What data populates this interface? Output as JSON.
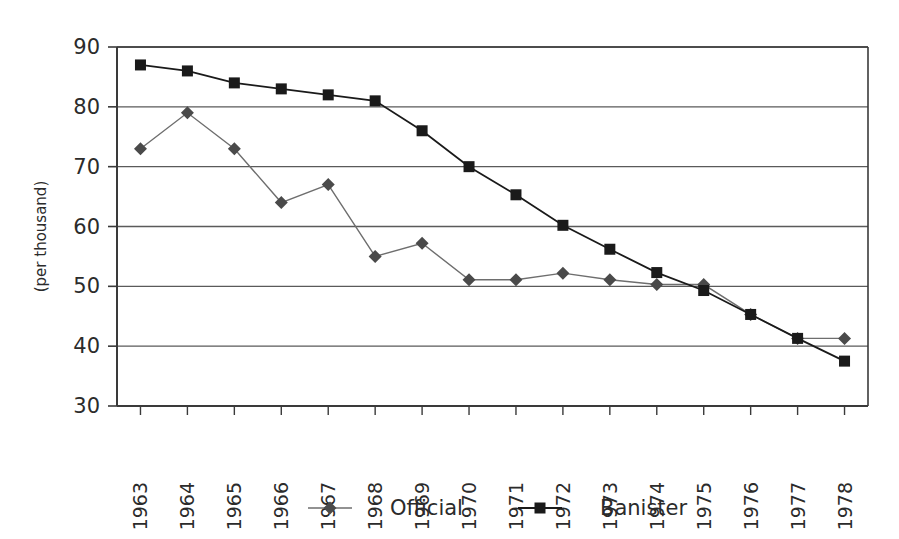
{
  "chart_data": {
    "type": "line",
    "title": "",
    "xlabel": "",
    "ylabel": "(per thousand)",
    "categories": [
      "1963",
      "1964",
      "1965",
      "1966",
      "1967",
      "1968",
      "1969",
      "1970",
      "1971",
      "1972",
      "1973",
      "1974",
      "1975",
      "1976",
      "1977",
      "1978"
    ],
    "ylim": [
      30,
      90
    ],
    "yticks": [
      30,
      40,
      50,
      60,
      70,
      80,
      90
    ],
    "grid": "horizontal",
    "legend_position": "bottom",
    "series": [
      {
        "name": "Official",
        "marker": "diamond",
        "color": "#4a4a4a",
        "line_color": "#6e6e6e",
        "values": [
          73,
          79,
          73,
          64,
          67,
          55,
          57.2,
          51.1,
          51.1,
          52.2,
          51.1,
          50.3,
          50.3,
          45.3,
          41.3,
          41.3
        ]
      },
      {
        "name": "Banister",
        "marker": "square",
        "color": "#1a1a1a",
        "line_color": "#1a1a1a",
        "values": [
          87,
          86,
          84,
          83,
          82,
          81,
          76,
          70,
          65.3,
          60.2,
          56.2,
          52.3,
          49.3,
          45.3,
          41.3,
          37.5
        ]
      }
    ]
  },
  "legend": {
    "items": [
      {
        "label": "Official"
      },
      {
        "label": "Banister"
      }
    ]
  },
  "axes": {
    "y_axis_label": "(per thousand)"
  }
}
